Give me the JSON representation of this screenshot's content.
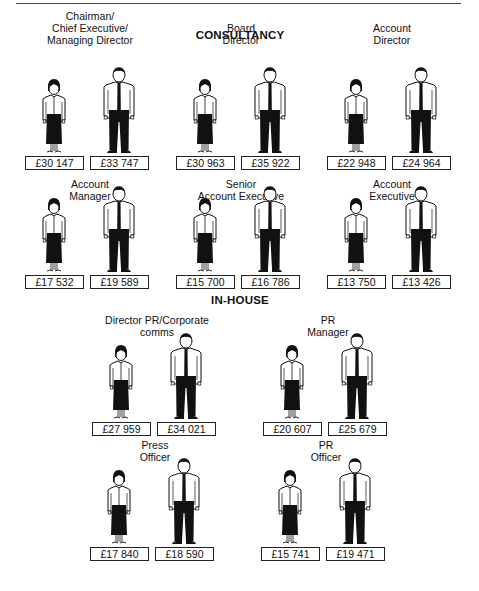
{
  "sections": {
    "consultancy": "CONSULTANCY",
    "in_house": "IN-HOUSE"
  },
  "legend": {
    "woman": "female employee figure",
    "man": "male employee figure"
  },
  "consultancy": [
    {
      "title_lines": [
        "Chairman/",
        "Chief Executive/",
        "Managing Director"
      ],
      "female": "£30 147",
      "male": "£33 747"
    },
    {
      "title_lines": [
        "Board",
        "Director"
      ],
      "female": "£30 963",
      "male": "£35 922"
    },
    {
      "title_lines": [
        "Account",
        "Director"
      ],
      "female": "£22 948",
      "male": "£24 964"
    },
    {
      "title_lines": [
        "Account",
        "Manager"
      ],
      "female": "£17 532",
      "male": "£19 589"
    },
    {
      "title_lines": [
        "Senior",
        "Account Executive"
      ],
      "female": "£15 700",
      "male": "£16 786"
    },
    {
      "title_lines": [
        "Account",
        "Executive"
      ],
      "female": "£13 750",
      "male": "£13 426"
    }
  ],
  "in_house": [
    {
      "title_lines": [
        "Director PR/Corporate",
        "comms"
      ],
      "female": "£27 959",
      "male": "£34 021"
    },
    {
      "title_lines": [
        "PR",
        "Manager"
      ],
      "female": "£20 607",
      "male": "£25 679"
    },
    {
      "title_lines": [
        "Press",
        "Officer"
      ],
      "female": "£17 840",
      "male": "£18 590"
    },
    {
      "title_lines": [
        "PR",
        "Officer"
      ],
      "female": "£15 741",
      "male": "£19 471"
    }
  ],
  "colors": {
    "ink": "#111111",
    "background": "#ffffff"
  }
}
